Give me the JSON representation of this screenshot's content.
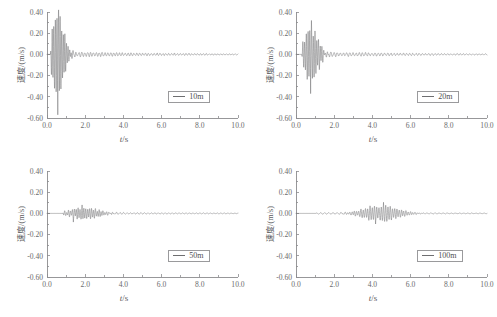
{
  "chart_data": {
    "type": "line",
    "title": "",
    "subtitle": "",
    "layout": {
      "rows": 2,
      "cols": 2,
      "grid": false,
      "legend_position": "lower-right",
      "spines": "left-bottom"
    },
    "xlabel": "t/s",
    "xlabel_italic_part": "t",
    "xlabel_rest": "/s",
    "ylabel": "速度/(m/s)",
    "xlim": [
      0.0,
      10.0
    ],
    "ylim": [
      -0.6,
      0.4
    ],
    "xticks": [
      0.0,
      2.0,
      4.0,
      6.0,
      8.0,
      10.0
    ],
    "xticklabels": [
      "0.0",
      "2.0",
      "4.0",
      "6.0",
      "8.0",
      "10.0"
    ],
    "xminor_count": 1,
    "yticks": [
      -0.6,
      -0.4,
      -0.2,
      0.0,
      0.2,
      0.4
    ],
    "yticklabels": [
      "-0.60",
      "-0.40",
      "-0.20",
      "0.00",
      "0.20",
      "0.40"
    ],
    "yminor_count": 1,
    "panels": [
      {
        "id": "panel-10m",
        "legend": "10m",
        "distance_m": 10,
        "seed": 1701,
        "onset_s": 0.18,
        "peak_positive": 0.42,
        "peak_negative": -0.57,
        "burst_center_s": 0.55,
        "burst_width_s": 0.42,
        "tail_amplitude": 0.055,
        "tail_decay_s": 6.0,
        "carrier_hz": 12.0,
        "noise_hz": 7.0,
        "sample_count": 1400
      },
      {
        "id": "panel-20m",
        "legend": "20m",
        "distance_m": 20,
        "seed": 2207,
        "onset_s": 0.3,
        "peak_positive": 0.32,
        "peak_negative": -0.37,
        "burst_center_s": 0.78,
        "burst_width_s": 0.5,
        "tail_amplitude": 0.05,
        "tail_decay_s": 6.5,
        "carrier_hz": 11.0,
        "noise_hz": 7.0,
        "sample_count": 1400
      },
      {
        "id": "panel-50m",
        "legend": "50m",
        "distance_m": 50,
        "seed": 5011,
        "onset_s": 0.8,
        "peak_positive": 0.08,
        "peak_negative": -0.082,
        "burst_center_s": 1.95,
        "burst_width_s": 1.0,
        "tail_amplitude": 0.022,
        "tail_decay_s": 7.5,
        "carrier_hz": 10.0,
        "noise_hz": 6.5,
        "sample_count": 1400
      },
      {
        "id": "panel-100m",
        "legend": "100m",
        "distance_m": 100,
        "seed": 9109,
        "onset_s": 1.05,
        "peak_positive": 0.105,
        "peak_negative": -0.1,
        "burst_center_s": 4.45,
        "burst_width_s": 1.25,
        "tail_amplitude": 0.016,
        "tail_decay_s": 9.0,
        "carrier_hz": 8.5,
        "noise_hz": 5.5,
        "sample_count": 1400
      }
    ],
    "colors": {
      "line": "#6e6e70",
      "axis": "#8c8c8e",
      "text": "#5c5c5e",
      "background": "#ffffff"
    }
  }
}
